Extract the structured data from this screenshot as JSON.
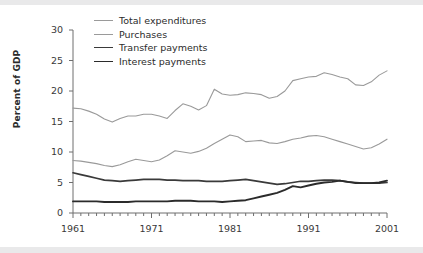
{
  "chart_data": {
    "type": "line",
    "title": "",
    "xlabel": "",
    "ylabel": "Percent of GDP",
    "xlim": [
      1961,
      2001
    ],
    "ylim": [
      0,
      30
    ],
    "xticks": [
      1961,
      1971,
      1981,
      1991,
      2001
    ],
    "yticks": [
      0,
      5,
      10,
      15,
      20,
      25,
      30
    ],
    "minor_xtick_interval": 1,
    "grid": false,
    "legend_position": "upper-left-inside",
    "x": [
      1961,
      1962,
      1963,
      1964,
      1965,
      1966,
      1967,
      1968,
      1969,
      1970,
      1971,
      1972,
      1973,
      1974,
      1975,
      1976,
      1977,
      1978,
      1979,
      1980,
      1981,
      1982,
      1983,
      1984,
      1985,
      1986,
      1987,
      1988,
      1989,
      1990,
      1991,
      1992,
      1993,
      1994,
      1995,
      1996,
      1997,
      1998,
      1999,
      2000,
      2001
    ],
    "series": [
      {
        "name": "Total expenditures",
        "color": "#9a9a9a",
        "width": 1.1,
        "values": [
          17.2,
          17.1,
          16.7,
          16.2,
          15.4,
          14.9,
          15.5,
          15.9,
          15.9,
          16.2,
          16.2,
          15.9,
          15.5,
          16.8,
          17.9,
          17.5,
          16.9,
          17.6,
          20.3,
          19.5,
          19.3,
          19.4,
          19.7,
          19.6,
          19.4,
          18.8,
          19.1,
          20.0,
          21.7,
          22.0,
          22.3,
          22.4,
          23.0,
          22.7,
          22.3,
          22.0,
          21.0,
          20.9,
          21.5,
          22.6,
          23.3
        ]
      },
      {
        "name": "Purchases",
        "color": "#9a9a9a",
        "width": 1.1,
        "values": [
          8.6,
          8.5,
          8.3,
          8.1,
          7.8,
          7.6,
          7.9,
          8.4,
          8.8,
          8.6,
          8.4,
          8.7,
          9.4,
          10.2,
          10.0,
          9.8,
          10.1,
          10.6,
          11.4,
          12.1,
          12.8,
          12.5,
          11.7,
          11.8,
          11.9,
          11.5,
          11.4,
          11.7,
          12.1,
          12.3,
          12.6,
          12.7,
          12.5,
          12.1,
          11.7,
          11.3,
          10.9,
          10.5,
          10.7,
          11.3,
          12.1
        ]
      },
      {
        "name": "Transfer payments",
        "color": "#3a3a3a",
        "width": 1.7,
        "values": [
          6.6,
          6.3,
          6.0,
          5.7,
          5.4,
          5.3,
          5.2,
          5.3,
          5.4,
          5.5,
          5.5,
          5.5,
          5.4,
          5.4,
          5.3,
          5.3,
          5.3,
          5.2,
          5.2,
          5.2,
          5.3,
          5.4,
          5.5,
          5.3,
          5.1,
          4.9,
          4.7,
          4.8,
          5.0,
          5.2,
          5.2,
          5.3,
          5.4,
          5.4,
          5.3,
          5.1,
          5.0,
          4.9,
          4.9,
          4.9,
          5.0
        ]
      },
      {
        "name": "Interest payments",
        "color": "#2b2b2b",
        "width": 1.9,
        "values": [
          1.9,
          1.9,
          1.9,
          1.9,
          1.8,
          1.8,
          1.8,
          1.8,
          1.9,
          1.9,
          1.9,
          1.9,
          1.9,
          2.0,
          2.0,
          2.0,
          1.9,
          1.9,
          1.9,
          1.8,
          1.9,
          2.0,
          2.1,
          2.4,
          2.7,
          3.0,
          3.3,
          3.8,
          4.4,
          4.2,
          4.5,
          4.8,
          5.0,
          5.1,
          5.3,
          5.1,
          4.9,
          4.9,
          4.9,
          5.0,
          5.3
        ]
      }
    ],
    "legend": [
      {
        "label": "Total expenditures",
        "color": "#9a9a9a",
        "width": 1.1
      },
      {
        "label": "Purchases",
        "color": "#9a9a9a",
        "width": 1.1
      },
      {
        "label": "Transfer payments",
        "color": "#3a3a3a",
        "width": 1.7
      },
      {
        "label": "Interest payments",
        "color": "#2b2b2b",
        "width": 1.9
      }
    ]
  },
  "axes": {
    "y_tick_labels": [
      "0",
      "5",
      "10",
      "15",
      "20",
      "25",
      "30"
    ],
    "x_tick_labels": [
      "1961",
      "1971",
      "1981",
      "1991",
      "2001"
    ],
    "y_axis_title": "Percent of GDP",
    "axis_color": "#6e6e6e"
  }
}
